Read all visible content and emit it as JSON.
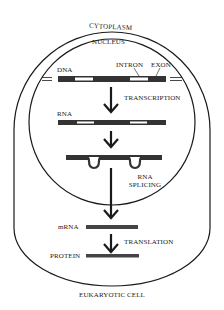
{
  "diagram": {
    "title": "EUKARYOTIC CELL",
    "regions": {
      "cytoplasm": "CYTOPLASM",
      "nucleus": "NUCLEUS"
    },
    "molecules": {
      "dna": "DNA",
      "intron": "INTRON",
      "exon": "EXON",
      "rna": "RNA",
      "mrna": "mRNA",
      "protein": "PROTEIN"
    },
    "steps": {
      "transcription": "TRANSCRIPTION",
      "splicing_line1": "RNA",
      "splicing_line2": "SPLICING",
      "translation": "TRANSLATION"
    },
    "flow": [
      "DNA",
      "RNA",
      "spliced RNA",
      "mRNA",
      "PROTEIN"
    ],
    "colors": {
      "line": "#1a1a1a",
      "exon": "#333333",
      "intron": "#ffffff",
      "background": "#ffffff"
    }
  }
}
